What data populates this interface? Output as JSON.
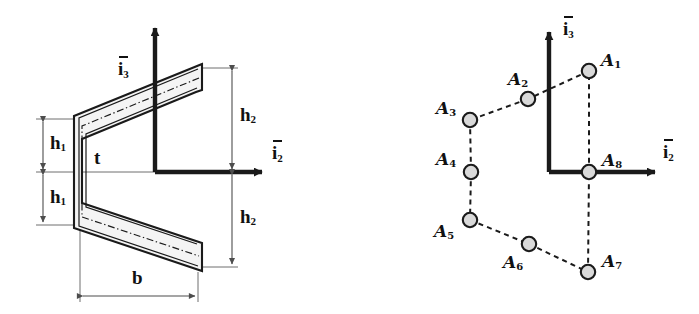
{
  "figure": {
    "colors": {
      "stroke": "#1a1a1a",
      "wall_fill": "#f2f2f2",
      "centerline": "#1a1a1a",
      "dimension_line": "#4d4d4d",
      "node_fill": "#d9d9d9",
      "node_stroke": "#1a1a1a",
      "dashed_link": "#1a1a1a",
      "background": "#ffffff"
    }
  },
  "left_panel": {
    "name": "cross-section-geometry",
    "axes": {
      "vertical": {
        "label_core": "i",
        "label_sub": "3",
        "overbar": true
      },
      "horizontal": {
        "label_core": "i",
        "label_sub": "2",
        "overbar": true
      }
    },
    "dimensions": [
      {
        "id": "h1-upper",
        "core": "h",
        "sub": "1",
        "orientation": "vertical",
        "side": "left"
      },
      {
        "id": "h1-lower",
        "core": "h",
        "sub": "1",
        "orientation": "vertical",
        "side": "left"
      },
      {
        "id": "h2-upper",
        "core": "h",
        "sub": "2",
        "orientation": "vertical",
        "side": "right"
      },
      {
        "id": "h2-lower",
        "core": "h",
        "sub": "2",
        "orientation": "vertical",
        "side": "right"
      },
      {
        "id": "b",
        "core": "b",
        "sub": "",
        "orientation": "horizontal",
        "side": "bottom"
      }
    ],
    "thickness_label": {
      "id": "t",
      "core": "t",
      "sub": ""
    }
  },
  "right_panel": {
    "name": "discretized-node-model",
    "axes": {
      "vertical": {
        "label_core": "i",
        "label_sub": "3",
        "overbar": true
      },
      "horizontal": {
        "label_core": "i",
        "label_sub": "2",
        "overbar": true
      }
    },
    "nodes": [
      {
        "id": "A1",
        "core": "A",
        "sub": "1",
        "x": 589,
        "y": 71,
        "label_x": 601,
        "label_y": 52
      },
      {
        "id": "A2",
        "core": "A",
        "sub": "2",
        "x": 528,
        "y": 99,
        "label_x": 508,
        "label_y": 71
      },
      {
        "id": "A3",
        "core": "A",
        "sub": "3",
        "x": 470,
        "y": 120,
        "label_x": 436,
        "label_y": 100
      },
      {
        "id": "A4",
        "core": "A",
        "sub": "4",
        "x": 471,
        "y": 172,
        "label_x": 436,
        "label_y": 151
      },
      {
        "id": "A5",
        "core": "A",
        "sub": "5",
        "x": 470,
        "y": 220,
        "label_x": 434,
        "label_y": 223
      },
      {
        "id": "A6",
        "core": "A",
        "sub": "6",
        "x": 529,
        "y": 244,
        "label_x": 503,
        "label_y": 254
      },
      {
        "id": "A7",
        "core": "A",
        "sub": "7",
        "x": 588,
        "y": 272,
        "label_x": 602,
        "label_y": 253
      },
      {
        "id": "A8",
        "core": "A",
        "sub": "8",
        "x": 589,
        "y": 172,
        "label_x": 602,
        "label_y": 152
      }
    ],
    "links": [
      [
        "A1",
        "A2"
      ],
      [
        "A2",
        "A3"
      ],
      [
        "A3",
        "A4"
      ],
      [
        "A4",
        "A5"
      ],
      [
        "A5",
        "A6"
      ],
      [
        "A6",
        "A7"
      ],
      [
        "A7",
        "A8"
      ],
      [
        "A8",
        "A1"
      ]
    ]
  }
}
